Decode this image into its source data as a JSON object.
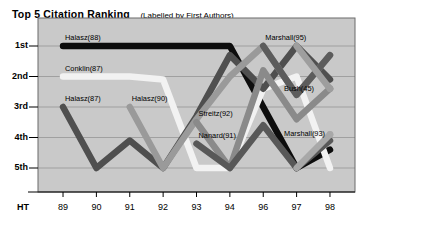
{
  "title": {
    "main": "Top 5 Citation Ranking",
    "subtitle": "(Labelled by First Authors)"
  },
  "chart_data": {
    "type": "line",
    "title": "Top 5 Citation Ranking (Labelled by First Authors)",
    "subtitle": "(Labelled by First Authors)",
    "xlabel": "",
    "ylabel": "",
    "axis_origin_label": "HT",
    "grid": true,
    "legend": "none",
    "legend_position": "inline-labels",
    "x": [
      "89",
      "90",
      "91",
      "92",
      "93",
      "94",
      "96",
      "97",
      "98"
    ],
    "xlim": [
      "89",
      "98"
    ],
    "y_categories": [
      "1st",
      "2nd",
      "3rd",
      "4th",
      "5th"
    ],
    "ylim": [
      1,
      5
    ],
    "y_inverted": true,
    "plot_background": "#c9c9c9",
    "series": [
      {
        "name": "Halasz(88)",
        "label": "Halasz(88)",
        "color": "#0d0d0d",
        "label_x": 89,
        "label_y": 1,
        "points": [
          {
            "x": "89",
            "y": 1
          },
          {
            "x": "90",
            "y": 1
          },
          {
            "x": "91",
            "y": 1
          },
          {
            "x": "92",
            "y": 1
          },
          {
            "x": "93",
            "y": 1
          },
          {
            "x": "94",
            "y": 1
          },
          {
            "x": "96",
            "y": 3
          },
          {
            "x": "97",
            "y": 5
          },
          {
            "x": "98",
            "y": 4.4
          }
        ]
      },
      {
        "name": "Conklin(87)",
        "label": "Conklin(87)",
        "color": "#f2f2f2",
        "label_x": 89,
        "label_y": 2,
        "points": [
          {
            "x": "89",
            "y": 2
          },
          {
            "x": "90",
            "y": 2
          },
          {
            "x": "91",
            "y": 2
          },
          {
            "x": "92",
            "y": 2.1
          },
          {
            "x": "93",
            "y": 5
          },
          {
            "x": "94",
            "y": 5
          },
          {
            "x": "96",
            "y": 2.4
          },
          {
            "x": "97",
            "y": 2
          },
          {
            "x": "98",
            "y": 5
          }
        ]
      },
      {
        "name": "Halasz(87)",
        "label": "Halasz(87)",
        "color": "#4f4f4f",
        "label_x": 89,
        "label_y": 3,
        "points": [
          {
            "x": "89",
            "y": 3
          },
          {
            "x": "90",
            "y": 5
          },
          {
            "x": "91",
            "y": 4.1
          },
          {
            "x": "92",
            "y": 5
          },
          {
            "x": "93",
            "y": 3.3
          },
          {
            "x": "94",
            "y": 1.3
          },
          {
            "x": "96",
            "y": 2.4
          },
          {
            "x": "97",
            "y": 1
          },
          {
            "x": "98",
            "y": 2.1
          }
        ]
      },
      {
        "name": "Halasz(90)",
        "label": "Halasz(90)",
        "color": "#9a9a9a",
        "label_x": 91,
        "label_y": 3,
        "points": [
          {
            "x": "91",
            "y": 3
          },
          {
            "x": "92",
            "y": 5
          },
          {
            "x": "93",
            "y": 3.4
          },
          {
            "x": "94",
            "y": 2
          },
          {
            "x": "96",
            "y": 1
          },
          {
            "x": "97",
            "y": 2.6
          },
          {
            "x": "98",
            "y": 1.3
          }
        ]
      },
      {
        "name": "Streitz(92)",
        "label": "Streitz(92)",
        "color": "#8a8a8a",
        "label_x": 93,
        "label_y": 3.5,
        "points": [
          {
            "x": "93",
            "y": 3.5
          },
          {
            "x": "94",
            "y": 5
          },
          {
            "x": "96",
            "y": 1.8
          },
          {
            "x": "97",
            "y": 3.4
          },
          {
            "x": "98",
            "y": 2.4
          }
        ]
      },
      {
        "name": "Nanard(91)",
        "label": "Nanard(91)",
        "color": "#585858",
        "label_x": 93,
        "label_y": 4.2,
        "points": [
          {
            "x": "93",
            "y": 4.2
          },
          {
            "x": "94",
            "y": 5
          },
          {
            "x": "96",
            "y": 3.6
          },
          {
            "x": "97",
            "y": 5
          },
          {
            "x": "98",
            "y": 4.1
          }
        ]
      },
      {
        "name": "Marshall(95)",
        "label": "Marshall(95)",
        "color": "#5c5c5c",
        "label_x": 96,
        "label_y": 1,
        "points": [
          {
            "x": "96",
            "y": 1
          },
          {
            "x": "97",
            "y": 2.6
          },
          {
            "x": "98",
            "y": 1.3
          }
        ]
      },
      {
        "name": "Bush(45)",
        "label": "Bush(45)",
        "color": "#9e9e9e",
        "label_x": 98,
        "label_y": 2.4,
        "marker": true,
        "points": [
          {
            "x": "97",
            "y": 1
          },
          {
            "x": "98",
            "y": 2.4
          }
        ]
      },
      {
        "name": "Marshall(93)",
        "label": "Marshall(93)",
        "color": "#a8a8a8",
        "label_x": 98,
        "label_y": 3.9,
        "marker": true,
        "points": [
          {
            "x": "97",
            "y": 5
          },
          {
            "x": "98",
            "y": 3.9
          }
        ]
      }
    ]
  },
  "y_axis": {
    "ticks": [
      "1st",
      "2nd",
      "3rd",
      "4th",
      "5th"
    ]
  },
  "x_axis": {
    "origin_label": "HT",
    "ticks": [
      "89",
      "90",
      "91",
      "92",
      "93",
      "94",
      "96",
      "97",
      "98"
    ]
  }
}
